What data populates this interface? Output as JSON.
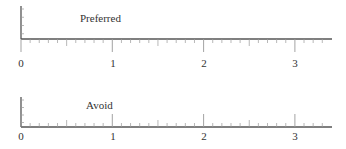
{
  "chart_data": [
    {
      "type": "number-line",
      "title": "Preferred",
      "xlabel": "",
      "ylabel": "",
      "xlim": [
        0,
        3.4
      ],
      "major_ticks": [
        0,
        1,
        2,
        3
      ],
      "tick_labels": [
        "0",
        "1",
        "2",
        "3"
      ],
      "minor_tick_step": 0.1,
      "tick_direction": "down",
      "grid": false,
      "values": []
    },
    {
      "type": "number-line",
      "title": "Avoid",
      "xlabel": "",
      "ylabel": "",
      "xlim": [
        0,
        3.4
      ],
      "major_ticks": [
        0,
        1,
        2,
        3
      ],
      "tick_labels": [
        "0",
        "1",
        "2",
        "3"
      ],
      "minor_tick_step": 0.1,
      "tick_direction": "up",
      "grid": false,
      "values": []
    }
  ],
  "panels": {
    "top": {
      "label": "Preferred",
      "ticks": [
        "0",
        "1",
        "2",
        "3"
      ]
    },
    "bottom": {
      "label": "Avoid",
      "ticks": [
        "0",
        "1",
        "2",
        "3"
      ]
    }
  },
  "colors": {
    "axis": "#555555",
    "tick": "#999999",
    "text": "#333333"
  }
}
